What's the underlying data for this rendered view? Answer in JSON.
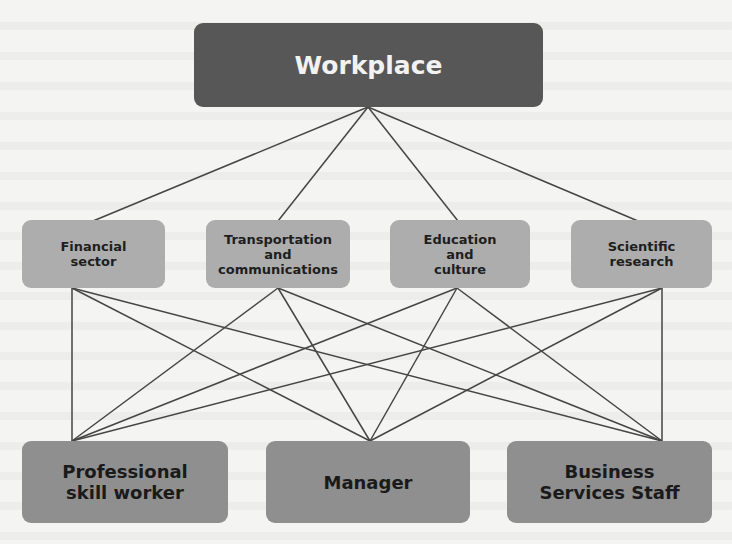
{
  "diagram": {
    "root": {
      "id": "workplace",
      "label": "Workplace"
    },
    "middle": [
      {
        "id": "financial",
        "label": "Financial\nsector"
      },
      {
        "id": "transport",
        "label": "Transportation\nand\ncommunications"
      },
      {
        "id": "education",
        "label": "Education\nand\nculture"
      },
      {
        "id": "scientific",
        "label": "Scientific\nresearch"
      }
    ],
    "bottom": [
      {
        "id": "professional",
        "label": "Professional\nskill worker"
      },
      {
        "id": "manager",
        "label": "Manager"
      },
      {
        "id": "business",
        "label": "Business\nServices Staff"
      }
    ],
    "edges": [
      [
        "workplace",
        "financial"
      ],
      [
        "workplace",
        "transport"
      ],
      [
        "workplace",
        "education"
      ],
      [
        "workplace",
        "scientific"
      ],
      [
        "financial",
        "professional"
      ],
      [
        "financial",
        "manager"
      ],
      [
        "financial",
        "business"
      ],
      [
        "transport",
        "professional"
      ],
      [
        "transport",
        "manager"
      ],
      [
        "transport",
        "business"
      ],
      [
        "education",
        "professional"
      ],
      [
        "education",
        "manager"
      ],
      [
        "education",
        "business"
      ],
      [
        "scientific",
        "professional"
      ],
      [
        "scientific",
        "manager"
      ],
      [
        "scientific",
        "business"
      ]
    ],
    "colors": {
      "root_fill": "#575757",
      "middle_fill": "#adadad",
      "bottom_fill": "#8f8f8f",
      "line": "#444444",
      "background": "#f4f4f2"
    }
  }
}
